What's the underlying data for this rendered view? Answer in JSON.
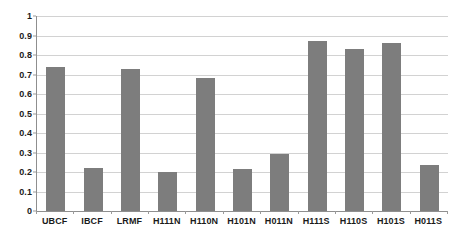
{
  "chart_data": {
    "type": "bar",
    "title": "",
    "xlabel": "",
    "ylabel": "",
    "ylim": [
      0,
      1
    ],
    "ytick_labels": [
      "1",
      "0.9",
      "0.8",
      "0.7",
      "0.6",
      "0.5",
      "0.4",
      "0.3",
      "0.2",
      "0.1",
      "0"
    ],
    "ytick_values": [
      1,
      0.9,
      0.8,
      0.7,
      0.6,
      0.5,
      0.4,
      0.3,
      0.2,
      0.1,
      0
    ],
    "grid": true,
    "legend": false,
    "bar_color": "#7d7d7d",
    "categories": [
      "UBCF",
      "IBCF",
      "LRMF",
      "H111N",
      "H110N",
      "H101N",
      "H011N",
      "H111S",
      "H110S",
      "H101S",
      "H011S"
    ],
    "values": [
      0.74,
      0.22,
      0.73,
      0.2,
      0.68,
      0.215,
      0.293,
      0.87,
      0.83,
      0.86,
      0.235
    ]
  }
}
